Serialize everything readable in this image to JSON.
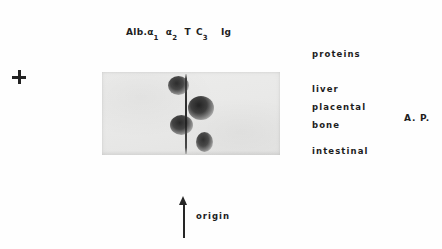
{
  "figure": {
    "background_color": "#fefefe",
    "ink_color": "#1d1d1d"
  },
  "lane_legend": {
    "items": [
      {
        "base": "Alb.",
        "sub": ""
      },
      {
        "base": "α",
        "sub": "1"
      },
      {
        "base": "α",
        "sub": "2"
      },
      {
        "base": "T",
        "sub": ""
      },
      {
        "base": "C",
        "sub": "3"
      },
      {
        "base": "Ig",
        "sub": ""
      }
    ]
  },
  "polarity_marker": {
    "symbol": "+",
    "name": "anode-plus"
  },
  "gel": {
    "panel_color": "#e9e9e8",
    "slit_color": "#232323",
    "left": 102,
    "top": 72,
    "width": 178,
    "height": 83,
    "slit_x": 83,
    "spots": [
      {
        "label": "liver",
        "x": 66,
        "y": 4,
        "w": 21,
        "h": 19,
        "opacity": 0.95
      },
      {
        "label": "placental",
        "x": 86,
        "y": 24,
        "w": 26,
        "h": 24,
        "opacity": 1.0
      },
      {
        "label": "bone",
        "x": 68,
        "y": 43,
        "w": 23,
        "h": 20,
        "opacity": 0.97
      },
      {
        "label": "intestinal",
        "x": 94,
        "y": 60,
        "w": 17,
        "h": 20,
        "opacity": 0.93
      }
    ]
  },
  "annotations": {
    "proteins": {
      "text": "proteins",
      "top": 49
    },
    "bands": [
      {
        "text": "liver",
        "top": 84
      },
      {
        "text": "placental",
        "top": 102
      },
      {
        "text": "bone",
        "top": 120
      },
      {
        "text": "intestinal",
        "top": 146
      }
    ],
    "group_label": "A. P."
  },
  "origin": {
    "label": "origin",
    "arrow_direction": "up"
  }
}
